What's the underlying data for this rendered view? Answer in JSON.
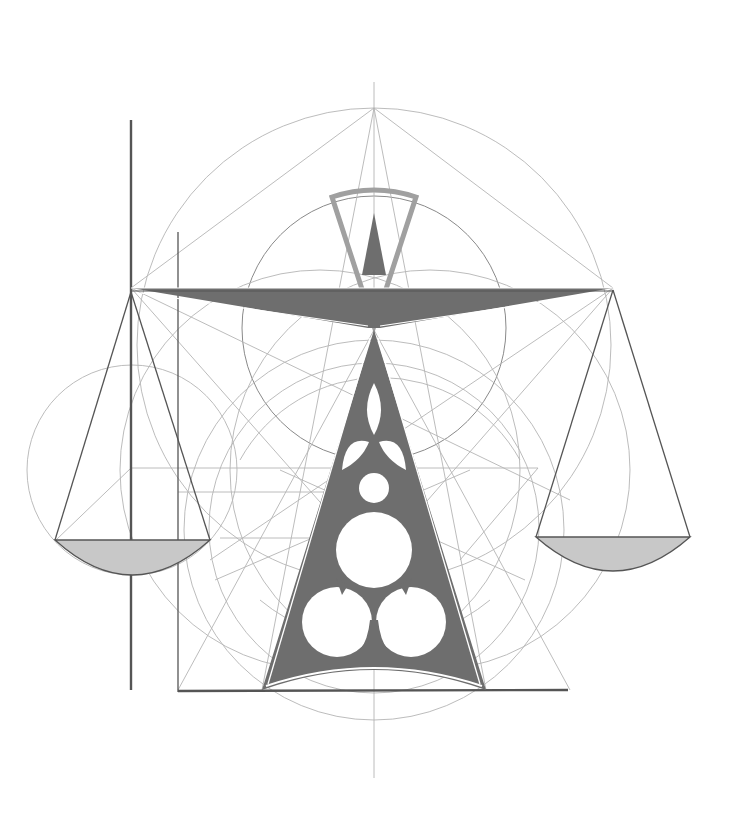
{
  "figure": {
    "colors": {
      "background": "#ffffff",
      "fill_dark": "#6e6e6e",
      "fill_light": "#c8c8c8",
      "frame_light": "#a0a0a0",
      "guide": "#b4b4b4",
      "ink": "#555555"
    },
    "elements": {
      "central_axis": "vertical-construction-line",
      "beam": "balance-beam",
      "pointer": "needle-pointer",
      "stand": "triangular-stand-with-trefoil-cutouts",
      "left_pan": "left-scale-pan",
      "right_pan": "right-scale-pan",
      "guides": "construction-circles-and-lines"
    }
  }
}
